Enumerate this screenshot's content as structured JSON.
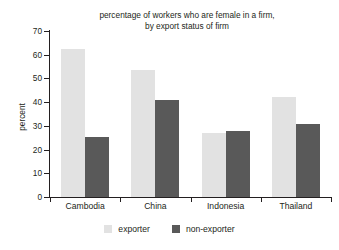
{
  "chart_data": {
    "type": "bar",
    "title": "percentage of workers who are female in a firm, by export status of firm",
    "title_line1": "percentage of workers who are female in a firm,",
    "title_line2": "by export status of firm",
    "xlabel": "",
    "ylabel": "percent",
    "ylim": [
      0,
      70
    ],
    "yticks": [
      0,
      10,
      20,
      30,
      40,
      50,
      60,
      70
    ],
    "grid": false,
    "legend_position": "bottom-center",
    "categories": [
      "Cambodia",
      "China",
      "Indonesia",
      "Thailand"
    ],
    "series": [
      {
        "name": "exporter",
        "color": "#e2e2e2",
        "values": [
          62.3,
          53.5,
          27.2,
          42.0
        ]
      },
      {
        "name": "non-exporter",
        "color": "#595959",
        "values": [
          25.5,
          40.7,
          27.7,
          30.8
        ]
      }
    ]
  },
  "colors": {
    "exporter": "#e2e2e2",
    "non_exporter": "#595959",
    "axis": "#231f20",
    "background": "#ffffff"
  }
}
